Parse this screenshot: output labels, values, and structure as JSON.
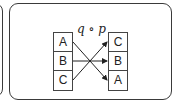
{
  "diagram": {
    "label": "q ∘ p",
    "left_column": [
      "A",
      "B",
      "C"
    ],
    "right_column": [
      "C",
      "B",
      "A"
    ],
    "mappings": [
      {
        "from": "A",
        "to": "A"
      },
      {
        "from": "B",
        "to": "B"
      },
      {
        "from": "C",
        "to": "C"
      }
    ],
    "colors": {
      "stroke": "#3a3a3a",
      "text": "#222222",
      "background": "#ffffff"
    }
  }
}
